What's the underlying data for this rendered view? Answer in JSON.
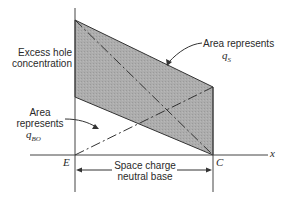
{
  "diagram": {
    "type": "excess hole concentration profile in transistor base",
    "labels": {
      "y_axis_line1": "Excess hole",
      "y_axis_line2": "concentration",
      "area_qs_line1": "Area represents",
      "area_qs_var": "q",
      "area_qs_sub": "S",
      "area_qbo_line1": "Area",
      "area_qbo_line2": "represents",
      "area_qbo_var": "q",
      "area_qbo_sub": "BO",
      "point_e": "E",
      "point_c": "C",
      "x_axis": "x",
      "base_line1": "Space charge",
      "base_line2": "neutral base"
    },
    "colors": {
      "shaded_region": "#a9a9a9",
      "lines": "#333333",
      "background": "#ffffff"
    }
  }
}
